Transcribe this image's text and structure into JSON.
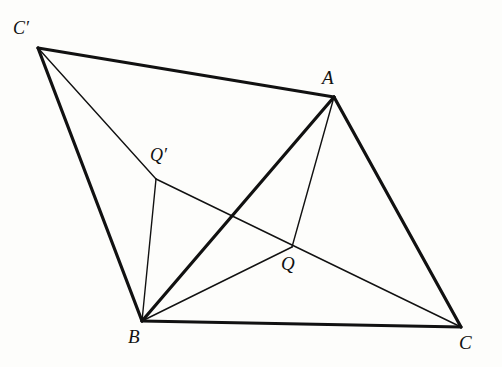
{
  "figure": {
    "width": 502,
    "height": 367,
    "background_color": "#fdfdfb",
    "stroke_color": "#111111",
    "thick_width": 3.2,
    "thin_width": 1.4
  },
  "points": {
    "A": {
      "label": "A",
      "x": 334,
      "y": 97,
      "label_x": 322,
      "label_y": 68
    },
    "B": {
      "label": "B",
      "x": 142,
      "y": 321,
      "label_x": 128,
      "label_y": 327
    },
    "C": {
      "label": "C",
      "x": 461,
      "y": 327,
      "label_x": 459,
      "label_y": 333
    },
    "Cp": {
      "label": "C′",
      "x": 38,
      "y": 48,
      "label_x": 13,
      "label_y": 19
    },
    "Q": {
      "label": "Q",
      "x": 292,
      "y": 247,
      "label_x": 281,
      "label_y": 254
    },
    "Qp": {
      "label": "Q′",
      "x": 156,
      "y": 179,
      "label_x": 150,
      "label_y": 146
    }
  },
  "segments": [
    {
      "name": "segment-c-prime-to-a",
      "from": "Cp",
      "to": "A",
      "weight": "thick"
    },
    {
      "name": "segment-c-prime-to-b",
      "from": "Cp",
      "to": "B",
      "weight": "thick"
    },
    {
      "name": "segment-b-to-a",
      "from": "B",
      "to": "A",
      "weight": "thick"
    },
    {
      "name": "segment-a-to-c",
      "from": "A",
      "to": "C",
      "weight": "thick"
    },
    {
      "name": "segment-b-to-c",
      "from": "B",
      "to": "C",
      "weight": "thick"
    },
    {
      "name": "segment-c-prime-to-q-prime",
      "from": "Cp",
      "to": "Qp",
      "weight": "thin"
    },
    {
      "name": "segment-q-prime-to-b",
      "from": "Qp",
      "to": "B",
      "weight": "thin"
    },
    {
      "name": "segment-q-prime-to-c",
      "from": "Qp",
      "to": "C",
      "weight": "thin"
    },
    {
      "name": "segment-a-to-q",
      "from": "A",
      "to": "Q",
      "weight": "thin"
    },
    {
      "name": "segment-b-to-q",
      "from": "B",
      "to": "Q",
      "weight": "thin"
    }
  ]
}
